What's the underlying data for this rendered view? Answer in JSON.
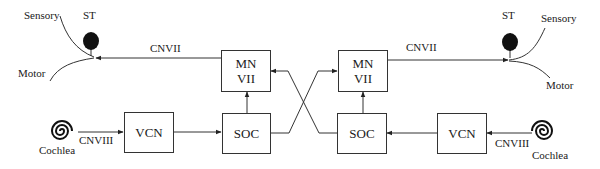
{
  "diagram": {
    "left": {
      "sensory_label": "Sensory",
      "motor_label": "Motor",
      "st_label": "ST",
      "cnvii_label": "CNVII",
      "cnviii_label": "CNVIII",
      "cochlea_label": "Cochlea",
      "mn_line1": "MN",
      "mn_line2": "VII",
      "vcn_label": "VCN",
      "soc_label": "SOC"
    },
    "right": {
      "sensory_label": "Sensory",
      "motor_label": "Motor",
      "st_label": "ST",
      "cnvii_label": "CNVII",
      "cnviii_label": "CNVIII",
      "cochlea_label": "Cochlea",
      "mn_line1": "MN",
      "mn_line2": "VII",
      "vcn_label": "VCN",
      "soc_label": "SOC"
    }
  }
}
